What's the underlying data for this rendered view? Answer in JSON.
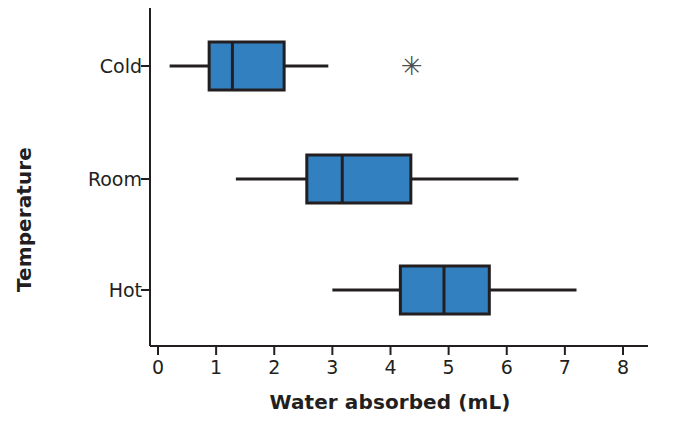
{
  "chart_data": {
    "type": "box",
    "orientation": "horizontal",
    "title": "",
    "xlabel": "Water absorbed (mL)",
    "ylabel": "Temperature",
    "xlim": [
      0,
      8
    ],
    "xticks": [
      0,
      1,
      2,
      3,
      4,
      5,
      6,
      7,
      8
    ],
    "xtick_labels": [
      "0",
      "1",
      "2",
      "3",
      "4",
      "5",
      "6",
      "7",
      "8"
    ],
    "categories": [
      "Cold",
      "Room",
      "Hot"
    ],
    "grid": false,
    "legend": false,
    "box_fill_color": "#3280c0",
    "line_color": "#231f20",
    "boxes": [
      {
        "category": "Cold",
        "whisker_low": 0.2,
        "q1": 0.88,
        "median": 1.28,
        "q3": 2.17,
        "whisker_high": 2.93,
        "outliers": [
          4.37
        ]
      },
      {
        "category": "Room",
        "whisker_low": 1.34,
        "q1": 2.56,
        "median": 3.17,
        "q3": 4.35,
        "whisker_high": 6.2,
        "outliers": []
      },
      {
        "category": "Hot",
        "whisker_low": 3.0,
        "q1": 4.17,
        "median": 4.92,
        "q3": 5.7,
        "whisker_high": 7.2,
        "outliers": []
      }
    ]
  }
}
